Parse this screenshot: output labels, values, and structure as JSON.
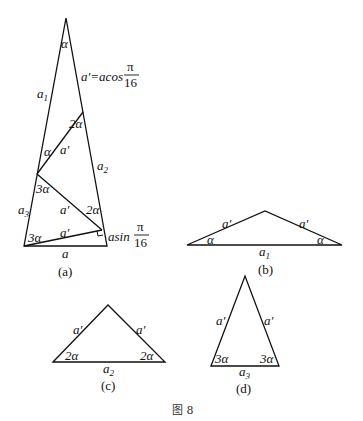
{
  "figure": {
    "caption": "图 8",
    "panels": [
      {
        "id": "a",
        "caption": "(a)",
        "labels": {
          "apex_angle": "α",
          "side_left_top": "a",
          "side_left_top_sub": "1",
          "formula_cos_prefix": "a′=acos",
          "formula_cos_num": "π",
          "formula_cos_den": "16",
          "angle_2a_top": "2α",
          "angle_a_left": "α",
          "seg_a_prime_1": "a′",
          "side_right": "a",
          "side_right_sub": "2",
          "angle_3a_mid": "3α",
          "side_left_bottom": "a",
          "side_left_bottom_sub": "3",
          "seg_a_prime_2": "a′",
          "angle_2a_mid": "2α",
          "angle_3a_bottom": "3α",
          "seg_a_prime_3": "a′",
          "formula_sin_prefix": "asin",
          "formula_sin_num": "π",
          "formula_sin_den": "16",
          "base": "a"
        }
      },
      {
        "id": "b",
        "caption": "(b)",
        "labels": {
          "left_side": "a′",
          "right_side": "a′",
          "left_angle": "α",
          "right_angle": "α",
          "base": "a",
          "base_sub": "1"
        }
      },
      {
        "id": "c",
        "caption": "(c)",
        "labels": {
          "left_side": "a′",
          "right_side": "a′",
          "left_angle": "2α",
          "right_angle": "2α",
          "base": "a",
          "base_sub": "2"
        }
      },
      {
        "id": "d",
        "caption": "(d)",
        "labels": {
          "left_side": "a′",
          "right_side": "a′",
          "left_angle": "3α",
          "right_angle": "3α",
          "base": "a",
          "base_sub": "3"
        }
      }
    ]
  }
}
